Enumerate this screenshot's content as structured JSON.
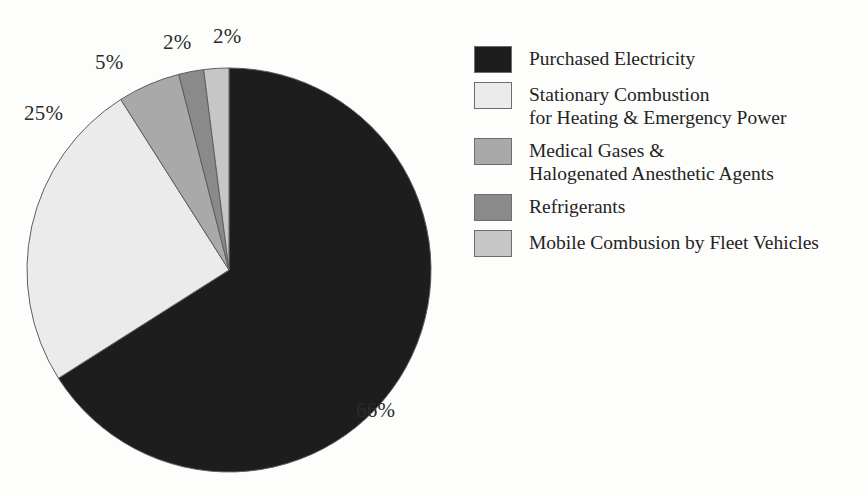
{
  "chart_data": {
    "type": "pie",
    "title": "",
    "categories": [
      "Purchased Electricity",
      "Stationary Combustion for Heating & Emergency Power",
      "Medical Gases & Halogenated Anesthetic Agents",
      "Refrigerants",
      "Mobile Combusion by Fleet Vehicles"
    ],
    "values": [
      66,
      25,
      5,
      2,
      2
    ],
    "value_labels": [
      "66%",
      "25%",
      "5%",
      "2%",
      "2%"
    ],
    "units": "percent",
    "colors": [
      "#1d1d1d",
      "#ebebeb",
      "#a9a9a9",
      "#8a8a8a",
      "#c6c6c6"
    ],
    "legend_position": "right",
    "start_angle_deg": 0,
    "direction": "clockwise",
    "slices": [
      {
        "label": "Purchased Electricity",
        "value": 66,
        "display": "66%",
        "color": "#1d1d1d"
      },
      {
        "label": "Stationary Combustion for Heating & Emergency Power",
        "value": 25,
        "display": "25%",
        "color": "#ebebeb"
      },
      {
        "label": "Medical Gases & Halogenated Anesthetic Agents",
        "value": 5,
        "display": "5%",
        "color": "#a9a9a9"
      },
      {
        "label": "Refrigerants",
        "value": 2,
        "display": "2%",
        "color": "#8a8a8a"
      },
      {
        "label": "Mobile Combusion by Fleet Vehicles",
        "value": 2,
        "display": "2%",
        "color": "#c6c6c6"
      }
    ]
  },
  "pie_labels": [
    {
      "text": "66%",
      "x": 356,
      "y": 400
    },
    {
      "text": "25%",
      "x": 24,
      "y": 103
    },
    {
      "text": "5%",
      "x": 95,
      "y": 52
    },
    {
      "text": "2%",
      "x": 163,
      "y": 32
    },
    {
      "text": "2%",
      "x": 213,
      "y": 26
    }
  ],
  "legend": {
    "items": [
      {
        "label": "Purchased Electricity",
        "color": "#1d1d1d"
      },
      {
        "label": "Stationary Combustion\nfor Heating & Emergency Power",
        "color": "#ebebeb"
      },
      {
        "label": "Medical Gases &\nHalogenated Anesthetic Agents",
        "color": "#a9a9a9"
      },
      {
        "label": "Refrigerants",
        "color": "#8a8a8a"
      },
      {
        "label": "Mobile Combusion by Fleet Vehicles",
        "color": "#c6c6c6"
      }
    ]
  }
}
